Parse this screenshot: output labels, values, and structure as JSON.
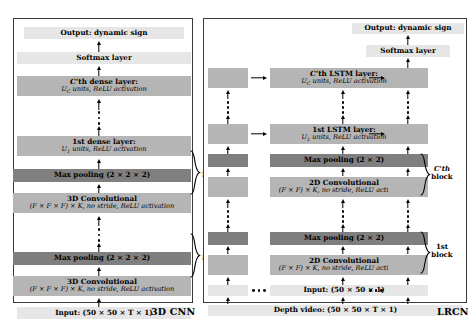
{
  "figure": {
    "type": "architecture-diagram",
    "panels": [
      {
        "id": "cnn",
        "caption": "3D CNN",
        "layers": [
          {
            "name": "output",
            "line1": "Output: dynamic sign",
            "line2": "",
            "shade": "#e6e6e6"
          },
          {
            "name": "softmax",
            "line1": "Softmax layer",
            "line2": "",
            "shade": "#e6e6e6"
          },
          {
            "name": "dense-c",
            "line1": "C'th dense layer:",
            "line2": "U_C units, ReLU activation",
            "shade": "#b5b5b5"
          },
          {
            "name": "dense-1",
            "line1": "1st dense layer:",
            "line2": "U_1 units, ReLU activation",
            "shade": "#b5b5b5"
          },
          {
            "name": "maxpool-c",
            "line1": "Max pooling (2 × 2 × 2)",
            "line2": "",
            "shade": "#7f7f7f"
          },
          {
            "name": "conv3d-c",
            "line1": "3D Convolutional",
            "line2": "(F × F × F) × K, no stride, ReLU activation",
            "shade": "#b5b5b5"
          },
          {
            "name": "maxpool-1",
            "line1": "Max pooling (2 × 2 × 2)",
            "line2": "",
            "shade": "#7f7f7f"
          },
          {
            "name": "conv3d-1",
            "line1": "3D Convolutional",
            "line2": "(F × F × F) × K, no stride, ReLU activation",
            "shade": "#b5b5b5"
          },
          {
            "name": "input",
            "line1": "Input: (50 × 50 × T × 1)",
            "line2": "",
            "shade": "#e6e6e6"
          }
        ],
        "block_labels": [
          {
            "name": "block-c",
            "line1": "C'th",
            "line2": "block"
          },
          {
            "name": "block-1",
            "line1": "1st",
            "line2": "block"
          }
        ]
      },
      {
        "id": "lrcn",
        "caption": "LRCN",
        "layers": [
          {
            "name": "output",
            "line1": "Output: dynamic sign",
            "line2": "",
            "shade": "#e6e6e6"
          },
          {
            "name": "softmax",
            "line1": "Softmax layer",
            "line2": "",
            "shade": "#e6e6e6"
          },
          {
            "name": "lstm-c",
            "line1": "C'th LSTM layer:",
            "line2": "U_C units, ReLU activation",
            "shade": "#b5b5b5"
          },
          {
            "name": "lstm-1",
            "line1": "1st LSTM layer:",
            "line2": "U_1 units, ReLU activation",
            "shade": "#b5b5b5"
          },
          {
            "name": "maxpool-c",
            "line1": "Max pooling (2 × 2)",
            "line2": "",
            "shade": "#7f7f7f"
          },
          {
            "name": "conv2d-c",
            "line1": "2D Convolutional",
            "line2": "(F × F) × K, no stride, ReLU activation",
            "shade": "#b5b5b5"
          },
          {
            "name": "maxpool-1",
            "line1": "Max pooling (2 × 2)",
            "line2": "",
            "shade": "#7f7f7f"
          },
          {
            "name": "conv2d-1",
            "line1": "2D Convolutional",
            "line2": "(F × F) × K, no stride, ReLU activation",
            "shade": "#b5b5b5"
          },
          {
            "name": "input",
            "line1": "Input: (50 × 50 × 1)",
            "line2": "",
            "shade": "#e6e6e6"
          },
          {
            "name": "depth-video",
            "line1": "Depth video: (50 × 50 × T × 1)",
            "line2": "",
            "shade": "#e6e6e6"
          }
        ],
        "block_labels": [
          {
            "name": "block-c",
            "line1": "C'th",
            "line2": "block"
          },
          {
            "name": "block-1",
            "line1": "1st",
            "line2": "block"
          }
        ]
      }
    ]
  }
}
